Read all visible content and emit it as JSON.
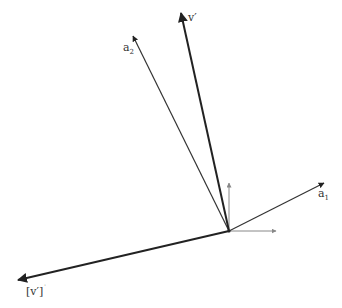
{
  "diagram": {
    "origin": {
      "x": 229,
      "y": 231
    },
    "vectors": [
      {
        "id": "v_prime",
        "label": "v′",
        "tip": {
          "x": 181,
          "y": 13
        },
        "stroke": "#222222",
        "width": 2
      },
      {
        "id": "a2",
        "label": "a",
        "sub": "2",
        "tip": {
          "x": 133,
          "y": 36
        },
        "stroke": "#333333",
        "width": 1.2
      },
      {
        "id": "a1",
        "label": "a",
        "sub": "1",
        "tip": {
          "x": 324,
          "y": 183
        },
        "stroke": "#333333",
        "width": 1.2
      },
      {
        "id": "v_prime_perp",
        "label": "[v′]",
        "sup": "˙",
        "tip": {
          "x": 18,
          "y": 280
        },
        "stroke": "#222222",
        "width": 2
      }
    ],
    "axes": [
      {
        "id": "axis-y",
        "tip": {
          "x": 229,
          "y": 183
        },
        "stroke": "#888888"
      },
      {
        "id": "axis-x",
        "tip": {
          "x": 276,
          "y": 231
        },
        "stroke": "#888888"
      }
    ]
  },
  "labels": {
    "v_prime": "v′",
    "a2_base": "a",
    "a2_sub": "2",
    "a1_base": "a",
    "a1_sub": "1",
    "v_perp_base": "[v′]",
    "v_perp_sup": "˙"
  }
}
